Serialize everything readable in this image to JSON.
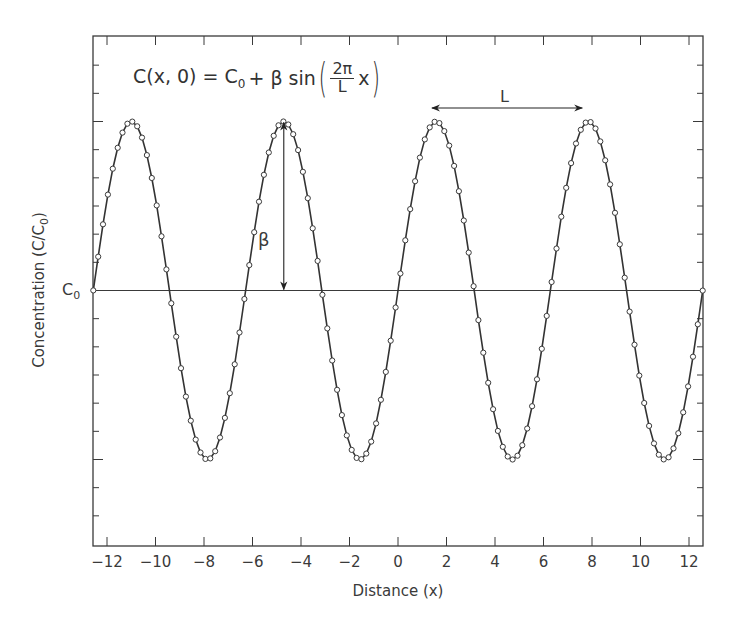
{
  "chart_data": {
    "type": "line",
    "title": "",
    "formula": {
      "lhs": "C(x, 0) = C",
      "lhs_sub": "0",
      "mid": " + β sin",
      "frac_num": "2π",
      "frac_den": "L",
      "var": "x"
    },
    "xlabel": "Distance (x)",
    "ylabel": "Concentration (C/C",
    "ylabel_sub": "0",
    "ylabel_close": ")",
    "y_ref_label": "C",
    "y_ref_sub": "0",
    "xlim": [
      -12.566,
      12.566
    ],
    "ylim": [
      -1.8,
      1.65
    ],
    "x_ticks": [
      -12,
      -10,
      -8,
      -6,
      -4,
      -2,
      0,
      2,
      4,
      6,
      8,
      10,
      12
    ],
    "x_tick_labels": [
      "−12",
      "−10",
      "−8",
      "−6",
      "−4",
      "−2",
      "0",
      "2",
      "4",
      "6",
      "8",
      "10",
      "12"
    ],
    "y_tick_step": 0.1667,
    "grid": false,
    "legend": null,
    "series": [
      {
        "name": "C(x,0) = C0 + β sin(2πx/L)",
        "function": "sin",
        "C0": 0,
        "beta": 1,
        "L": 6.2832,
        "x_start": -12.566,
        "x_end": 12.566,
        "n_points": 126,
        "marker": "open-circle",
        "line_color": "#333333"
      }
    ],
    "annotations": [
      {
        "type": "double-arrow-vertical",
        "label": "β",
        "x": -4.71,
        "y_from": 0,
        "y_to": 1
      },
      {
        "type": "double-arrow-horizontal",
        "label": "L",
        "x_from": 1.4,
        "x_to": 7.6,
        "y": 1.1
      },
      {
        "type": "hline",
        "label": "C0",
        "y": 0
      }
    ]
  }
}
